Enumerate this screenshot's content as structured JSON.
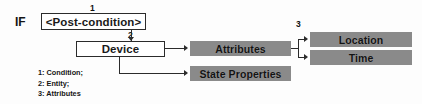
{
  "diagram": {
    "colors": {
      "filled_node": "#8a8a8a",
      "outline_node": "#ffffff",
      "stroke": "#2b2b2b",
      "text": "#151515",
      "background": "#fdfdfd"
    },
    "prefix_label": "IF",
    "nodes": [
      {
        "id": "postcondition",
        "label": "<Post-condition>",
        "style": "outline"
      },
      {
        "id": "device",
        "label": "Device",
        "style": "outline"
      },
      {
        "id": "attributes",
        "label": "Attributes",
        "style": "filled"
      },
      {
        "id": "state_properties",
        "label": "State Properties",
        "style": "filled"
      },
      {
        "id": "location",
        "label": "Location",
        "style": "filled"
      },
      {
        "id": "time",
        "label": "Time",
        "style": "filled"
      }
    ],
    "markers": [
      {
        "id": "1",
        "text": "1",
        "annotates": "postcondition"
      },
      {
        "id": "2",
        "text": "2",
        "annotates": "device"
      },
      {
        "id": "3",
        "text": "3",
        "annotates": "location"
      }
    ],
    "edges": [
      {
        "from": "postcondition",
        "to": "device"
      },
      {
        "from": "device",
        "to": "attributes"
      },
      {
        "from": "device",
        "to": "state_properties"
      },
      {
        "from": "attributes",
        "to": "location"
      },
      {
        "from": "attributes",
        "to": "time"
      }
    ],
    "legend": [
      "1: Condition;",
      "2: Entity;",
      "3: Attributes"
    ]
  }
}
